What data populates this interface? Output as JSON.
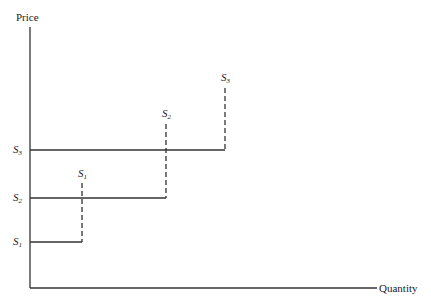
{
  "diagram": {
    "y_axis_label": "Price",
    "x_axis_label": "Quantity",
    "price_labels": [
      {
        "letter": "S",
        "sub": "1"
      },
      {
        "letter": "S",
        "sub": "2"
      },
      {
        "letter": "S",
        "sub": "3"
      }
    ],
    "supply_labels": [
      {
        "letter": "S",
        "sub": "1"
      },
      {
        "letter": "S",
        "sub": "2"
      },
      {
        "letter": "S",
        "sub": "3"
      }
    ]
  }
}
